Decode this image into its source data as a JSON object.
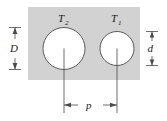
{
  "figure": {
    "type": "engineering-cross-section-diagram",
    "background_color": "#ffffff",
    "block": {
      "name": "rectangular-block",
      "fill_color": "#d2d2d2",
      "stroke_color": "#d2d2d2",
      "x": 28,
      "y": 7,
      "width": 112,
      "height": 73
    },
    "holes": [
      {
        "id": "hole-large",
        "label": "T",
        "subscript": "2",
        "label_full": "T2",
        "cx": 64,
        "cy": 48.5,
        "r": 21,
        "fill_color": "#ffffff",
        "stroke_color": "#4a4a4a"
      },
      {
        "id": "hole-small",
        "label": "T",
        "subscript": "1",
        "label_full": "T1",
        "cx": 117,
        "cy": 48.5,
        "r": 17,
        "fill_color": "#ffffff",
        "stroke_color": "#4a4a4a"
      }
    ],
    "dimensions": [
      {
        "id": "dimension-D",
        "label": "D",
        "orientation": "vertical",
        "position": "left",
        "meaning": "diameter of large hole",
        "x": 15,
        "y_start": 27.5,
        "y_end": 69.5
      },
      {
        "id": "dimension-d",
        "label": "d",
        "orientation": "vertical",
        "position": "right",
        "meaning": "diameter of small hole",
        "x": 152,
        "y_start": 31.5,
        "y_end": 65.5
      },
      {
        "id": "dimension-p",
        "label": "p",
        "orientation": "horizontal",
        "position": "bottom",
        "meaning": "center-to-center pitch spacing",
        "y": 105,
        "x_start": 64,
        "x_end": 117
      }
    ],
    "center_lines": [
      {
        "id": "center-line-large-hole",
        "x": 64,
        "y_start": 48.5,
        "y_end": 113
      },
      {
        "id": "center-line-small-hole",
        "x": 117,
        "y_start": 48.5,
        "y_end": 113
      }
    ],
    "line_color": "#4a4a4a"
  }
}
